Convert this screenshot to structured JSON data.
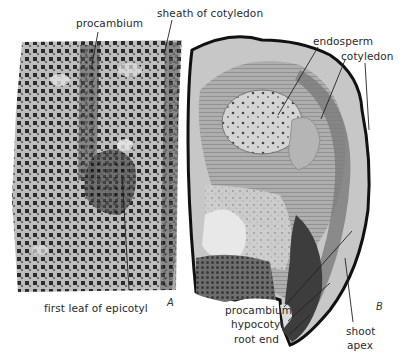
{
  "figure": {
    "panels": [
      {
        "id": "A",
        "letter": "A",
        "description": "longitudinal section micrograph of embryo tissue",
        "labels": {
          "procambium": "procambium",
          "sheath_of_cotyledon": "sheath of cotyledon",
          "first_leaf_of_epicotyl": "first leaf of epicotyl"
        }
      },
      {
        "id": "B",
        "letter": "B",
        "description": "section micrograph of seed with curved embryo",
        "labels": {
          "endosperm": "endosperm",
          "cotyledon": "cotyledon",
          "procambium": "procambium",
          "hypocotyl": "hypocotyl",
          "root_end": "root end",
          "shoot_line1": "shoot",
          "shoot_line2": "apex"
        }
      }
    ]
  }
}
